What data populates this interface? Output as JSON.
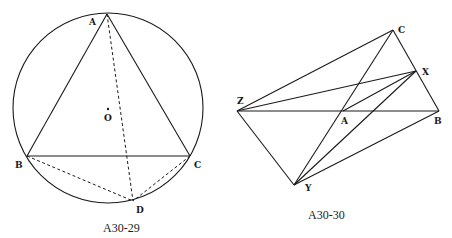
{
  "figures": [
    {
      "caption": "A30-29",
      "circle": {
        "center": [
          108,
          108
        ],
        "radius": 95
      },
      "points": {
        "A": {
          "label": "A",
          "x": 107,
          "y": 14
        },
        "B": {
          "label": "B",
          "x": 27,
          "y": 156
        },
        "C": {
          "label": "C",
          "x": 190,
          "y": 156
        },
        "D": {
          "label": "D",
          "x": 133,
          "y": 201
        },
        "O": {
          "label": "O",
          "x": 108,
          "y": 108
        }
      },
      "solid_segments": [
        [
          "A",
          "B"
        ],
        [
          "A",
          "C"
        ],
        [
          "B",
          "C"
        ]
      ],
      "dashed_segments": [
        [
          "A",
          "D"
        ],
        [
          "B",
          "D"
        ],
        [
          "C",
          "D"
        ]
      ]
    },
    {
      "caption": "A30-30",
      "points": {
        "Z": {
          "label": "Z",
          "x": 237,
          "y": 111
        },
        "A": {
          "label": "A",
          "x": 343,
          "y": 111
        },
        "B": {
          "label": "B",
          "x": 439,
          "y": 111
        },
        "C": {
          "label": "C",
          "x": 393,
          "y": 30
        },
        "X": {
          "label": "X",
          "x": 416,
          "y": 71
        },
        "Y": {
          "label": "Y",
          "x": 294,
          "y": 185
        }
      },
      "solid_segments": [
        [
          "Z",
          "C"
        ],
        [
          "Z",
          "X"
        ],
        [
          "Z",
          "B"
        ],
        [
          "Z",
          "Y"
        ],
        [
          "C",
          "B"
        ],
        [
          "C",
          "Y"
        ],
        [
          "X",
          "A"
        ],
        [
          "X",
          "Y"
        ],
        [
          "Y",
          "B"
        ]
      ]
    }
  ]
}
